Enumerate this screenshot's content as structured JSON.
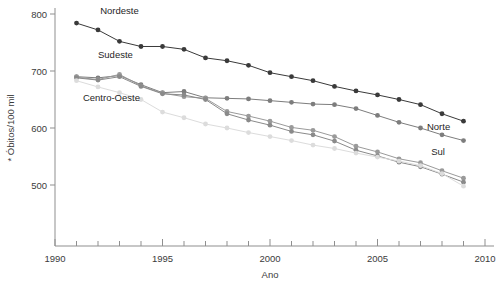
{
  "chart_data": {
    "type": "line",
    "title": "",
    "subtitle": "",
    "xlabel": "Ano",
    "ylabel": "* Óbitos/100 mil",
    "xlim": [
      1990,
      2010
    ],
    "ylim": [
      450,
      810
    ],
    "grid": false,
    "legend_position": "inline-annotations",
    "x_ticks_major": [
      1990,
      1995,
      2000,
      2005,
      2010
    ],
    "x_ticks_minor": [
      1991,
      1992,
      1993,
      1994,
      1996,
      1997,
      1998,
      1999,
      2001,
      2002,
      2003,
      2004,
      2006,
      2007,
      2008,
      2009
    ],
    "y_ticks": [
      500,
      600,
      700,
      800
    ],
    "x": [
      1991,
      1992,
      1993,
      1994,
      1995,
      1996,
      1997,
      1998,
      1999,
      2000,
      2001,
      2002,
      2003,
      2004,
      2005,
      2006,
      2007,
      2008,
      2009
    ],
    "series": [
      {
        "name": "Nordeste",
        "color": "#3a3a3a",
        "label_x": 1992.1,
        "label_y": 800,
        "values": [
          784,
          772,
          752,
          743,
          743,
          738,
          723,
          718,
          710,
          697,
          690,
          683,
          673,
          665,
          658,
          650,
          641,
          625,
          612
        ]
      },
      {
        "name": "Sudeste",
        "color": "#7d7d7d",
        "label_x": 1992.0,
        "label_y": 722,
        "values": [
          690,
          688,
          692,
          676,
          662,
          664,
          653,
          652,
          651,
          648,
          645,
          642,
          641,
          634,
          622,
          610,
          600,
          588,
          578
        ]
      },
      {
        "name": "Centro-Oeste",
        "color": "#9a9a9a",
        "label_x": 1991.3,
        "label_y": 648,
        "values": [
          689,
          685,
          694,
          674,
          661,
          655,
          652,
          629,
          621,
          612,
          601,
          596,
          585,
          568,
          558,
          546,
          539,
          525,
          512
        ]
      },
      {
        "name": "Norte",
        "color": "#8a8a8a",
        "label_x": 2007.3,
        "label_y": 596,
        "values": [
          688,
          684,
          690,
          673,
          660,
          658,
          650,
          625,
          614,
          605,
          594,
          588,
          577,
          561,
          551,
          540,
          532,
          519,
          505
        ]
      },
      {
        "name": "Sul",
        "color": "#dcdcdc",
        "label_x": 2007.5,
        "label_y": 552,
        "values": [
          683,
          672,
          662,
          650,
          628,
          618,
          607,
          600,
          592,
          585,
          578,
          570,
          564,
          556,
          549,
          542,
          534,
          520,
          498
        ]
      }
    ],
    "axis_color": "#8f8f8f",
    "text_color": "#3b3b3b"
  }
}
